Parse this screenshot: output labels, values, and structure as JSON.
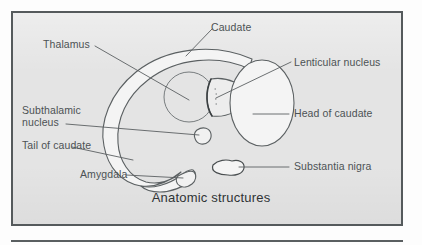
{
  "figure": {
    "caption": "Anatomic structures",
    "frame_border_color": "#555a5c",
    "background_color": "#e4e4e4",
    "label_color": "#4c5254",
    "outline_color": "#5b6062",
    "fill_color": "#f2f2f2"
  },
  "labels": {
    "thalamus": "Thalamus",
    "caudate": "Caudate",
    "lenticular_nucleus": "Lenticular nucleus",
    "head_of_caudate": "Head of caudate",
    "subthalamic_nucleus_line1": "Subthalamic",
    "subthalamic_nucleus_line2": "nucleus",
    "tail_of_caudate": "Tail of caudate",
    "amygdala": "Amygdala",
    "substantia_nigra": "Substantia nigra"
  },
  "structures": [
    {
      "name": "caudate-body",
      "label": "Caudate"
    },
    {
      "name": "thalamus",
      "label": "Thalamus"
    },
    {
      "name": "lenticular-nucleus",
      "label": "Lenticular nucleus"
    },
    {
      "name": "head-of-caudate",
      "label": "Head of caudate"
    },
    {
      "name": "subthalamic-nucleus",
      "label": "Subthalamic nucleus"
    },
    {
      "name": "tail-of-caudate",
      "label": "Tail of caudate"
    },
    {
      "name": "amygdala",
      "label": "Amygdala"
    },
    {
      "name": "substantia-nigra",
      "label": "Substantia nigra"
    }
  ]
}
